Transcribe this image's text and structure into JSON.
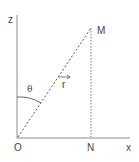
{
  "diagram": {
    "title": "",
    "labels": {
      "z_axis": "z",
      "x_axis": "x",
      "origin": "O",
      "point_m": "M",
      "point_n": "N",
      "angle": "θ",
      "vector": "r"
    },
    "colors": {
      "axis": "#888888",
      "line": "#555555",
      "text": "#444444",
      "background": "#ffffff"
    }
  }
}
